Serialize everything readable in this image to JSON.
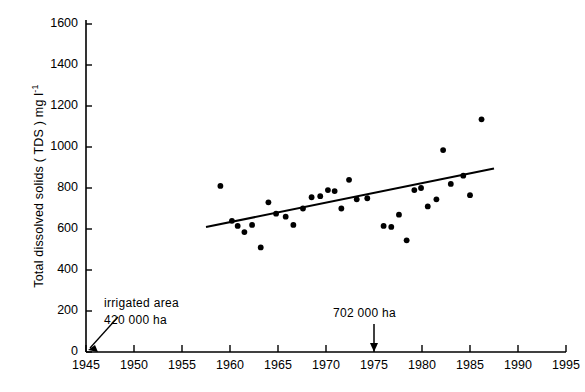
{
  "chart_data": {
    "type": "scatter",
    "title": "",
    "xlabel": "",
    "ylabel": "Total dissolved solids ( TDS ) mg l−1",
    "ylabel_parts": {
      "main": "Total dissolved solids ( TDS ) mg l",
      "exponent": "-1"
    },
    "xlim": [
      1945,
      1995
    ],
    "ylim": [
      0,
      1600
    ],
    "xticks": [
      1945,
      1950,
      1955,
      1960,
      1965,
      1970,
      1975,
      1980,
      1985,
      1990,
      1995
    ],
    "yticks": [
      0,
      200,
      400,
      600,
      800,
      1000,
      1200,
      1400,
      1600
    ],
    "grid": false,
    "legend": false,
    "marker_color": "#000000",
    "line_color": "#000000",
    "points": [
      {
        "x": 1959.0,
        "y": 810
      },
      {
        "x": 1960.2,
        "y": 640
      },
      {
        "x": 1960.8,
        "y": 615
      },
      {
        "x": 1961.5,
        "y": 585
      },
      {
        "x": 1962.3,
        "y": 620
      },
      {
        "x": 1963.2,
        "y": 510
      },
      {
        "x": 1964.0,
        "y": 730
      },
      {
        "x": 1964.8,
        "y": 675
      },
      {
        "x": 1965.8,
        "y": 660
      },
      {
        "x": 1966.6,
        "y": 620
      },
      {
        "x": 1967.6,
        "y": 700
      },
      {
        "x": 1968.5,
        "y": 755
      },
      {
        "x": 1969.4,
        "y": 760
      },
      {
        "x": 1970.2,
        "y": 790
      },
      {
        "x": 1970.9,
        "y": 785
      },
      {
        "x": 1971.6,
        "y": 700
      },
      {
        "x": 1972.4,
        "y": 840
      },
      {
        "x": 1973.2,
        "y": 745
      },
      {
        "x": 1974.3,
        "y": 750
      },
      {
        "x": 1976.0,
        "y": 615
      },
      {
        "x": 1976.8,
        "y": 610
      },
      {
        "x": 1977.6,
        "y": 670
      },
      {
        "x": 1978.4,
        "y": 545
      },
      {
        "x": 1979.2,
        "y": 790
      },
      {
        "x": 1979.9,
        "y": 800
      },
      {
        "x": 1980.6,
        "y": 710
      },
      {
        "x": 1981.5,
        "y": 745
      },
      {
        "x": 1982.2,
        "y": 985
      },
      {
        "x": 1983.0,
        "y": 820
      },
      {
        "x": 1984.3,
        "y": 860
      },
      {
        "x": 1985.0,
        "y": 765
      },
      {
        "x": 1986.2,
        "y": 1135
      }
    ],
    "trend_line": {
      "label": "linear trend",
      "x_start": 1957.5,
      "y_start": 610,
      "x_end": 1987.5,
      "y_end": 895
    },
    "annotations": [
      {
        "id": "irrigated-area-1945",
        "line1": "irrigated area",
        "line2": "420 000 ha",
        "arrow_to_x": 1945,
        "arrow_to_y": 0
      },
      {
        "id": "irrigated-area-1975",
        "line1": "702 000 ha",
        "line2": "",
        "arrow_to_x": 1975,
        "arrow_to_y": 0
      }
    ]
  },
  "ytick_labels": [
    "1600",
    "1400",
    "1200",
    "1000",
    "800",
    "600",
    "400",
    "200",
    "0"
  ],
  "xtick_labels": [
    "1945",
    "1950",
    "1955",
    "1960",
    "1965",
    "1970",
    "1975",
    "1980",
    "1985",
    "1990",
    "1995"
  ],
  "annotations": {
    "left": {
      "line1": "irrigated area",
      "line2": "420 000 ha"
    },
    "right": {
      "line1": "702 000 ha"
    }
  }
}
